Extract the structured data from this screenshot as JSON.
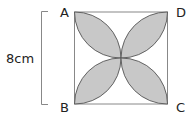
{
  "diagram": {
    "vertices": {
      "a": "A",
      "b": "B",
      "c": "C",
      "d": "D"
    },
    "side_label": "8cm",
    "colors": {
      "fill": "#c8c8c8",
      "stroke": "#555555",
      "square": "#888888"
    }
  }
}
